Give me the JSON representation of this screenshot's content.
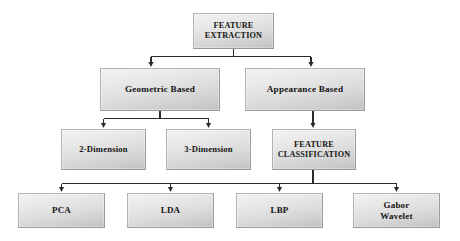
{
  "diagram": {
    "background_color": "#ffffff",
    "node_fill_top": "#f2f2f2",
    "node_fill_bottom": "#bfbfbf",
    "node_border_color": "#b2b2b2",
    "edge_color": "#2b2b2b",
    "text_color": "#141414",
    "nodes": {
      "root": "FEATURE\nEXTRACTION",
      "geometric": "Geometric Based",
      "appearance": "Appearance Based",
      "two_dimension": "2-Dimension",
      "three_dimension": "3-Dimension",
      "feature_classification": "FEATURE\nCLASSIFICATION",
      "pca": "PCA",
      "lda": "LDA",
      "lbp": "LBP",
      "gabor": "Gabor\nWavelet"
    },
    "levels": [
      {
        "name": "level-1",
        "items": [
          "FEATURE EXTRACTION"
        ]
      },
      {
        "name": "level-2",
        "items": [
          "Geometric Based",
          "Appearance Based"
        ]
      },
      {
        "name": "level-3",
        "items": [
          "2-Dimension",
          "3-Dimension",
          "FEATURE CLASSIFICATION"
        ]
      },
      {
        "name": "level-4",
        "items": [
          "PCA",
          "LDA",
          "LBP",
          "Gabor Wavelet"
        ]
      }
    ],
    "edges": [
      {
        "from": "FEATURE EXTRACTION",
        "to": "Geometric Based"
      },
      {
        "from": "FEATURE EXTRACTION",
        "to": "Appearance Based"
      },
      {
        "from": "Geometric Based",
        "to": "2-Dimension"
      },
      {
        "from": "Geometric Based",
        "to": "3-Dimension"
      },
      {
        "from": "Appearance Based",
        "to": "FEATURE CLASSIFICATION"
      },
      {
        "from": "FEATURE CLASSIFICATION",
        "to": "PCA"
      },
      {
        "from": "FEATURE CLASSIFICATION",
        "to": "LDA"
      },
      {
        "from": "FEATURE CLASSIFICATION",
        "to": "LBP"
      },
      {
        "from": "FEATURE CLASSIFICATION",
        "to": "Gabor Wavelet"
      }
    ]
  }
}
